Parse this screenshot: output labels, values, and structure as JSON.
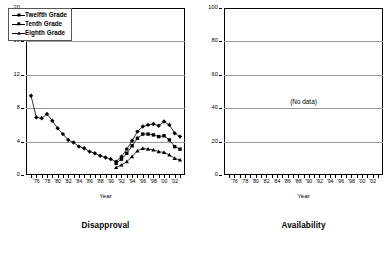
{
  "charts": [
    {
      "key": "disapproval",
      "title": "Disapproval",
      "xlabel": "Year",
      "nodata_text": ""
    },
    {
      "key": "availability",
      "title": "Availability",
      "xlabel": "Year",
      "nodata_text": "(No data)"
    }
  ],
  "legend": {
    "items": [
      {
        "label": "Twelfth Grade",
        "marker": "diamond"
      },
      {
        "label": "Tenth Grade",
        "marker": "square"
      },
      {
        "label": "Eighth Grade",
        "marker": "triangle"
      }
    ]
  },
  "chart_data": [
    {
      "type": "line",
      "title": "Disapproval",
      "xlabel": "Year",
      "ylabel": "",
      "ylim": [
        0,
        20
      ],
      "yticks": [
        0,
        4,
        8,
        12,
        16,
        20
      ],
      "grid": true,
      "legend_position": "top-left",
      "x": [
        1975,
        1976,
        1977,
        1978,
        1979,
        1980,
        1981,
        1982,
        1983,
        1984,
        1985,
        1986,
        1987,
        1988,
        1989,
        1990,
        1991,
        1992,
        1993,
        1994,
        1995,
        1996,
        1997,
        1998,
        1999,
        2000,
        2001,
        2002,
        2003
      ],
      "xtick_labels": [
        "'76",
        "'78",
        "'80",
        "'82",
        "'84",
        "'86",
        "'88",
        "'90",
        "'92",
        "'94",
        "'96",
        "'98",
        "'00",
        "'02"
      ],
      "series": [
        {
          "name": "Twelfth Grade",
          "marker": "diamond",
          "x": [
            1975,
            1976,
            1977,
            1978,
            1979,
            1980,
            1981,
            1982,
            1983,
            1984,
            1985,
            1986,
            1987,
            1988,
            1989,
            1990,
            1991,
            1992,
            1993,
            1994,
            1995,
            1996,
            1997,
            1998,
            1999,
            2000,
            2001,
            2002,
            2003
          ],
          "values": [
            9.5,
            6.9,
            6.8,
            7.3,
            6.5,
            5.6,
            4.9,
            4.2,
            3.9,
            3.4,
            3.2,
            2.8,
            2.6,
            2.3,
            2.1,
            1.9,
            1.6,
            2.2,
            3.1,
            4.1,
            5.2,
            5.8,
            6.0,
            6.1,
            5.9,
            6.4,
            6.0,
            5.0,
            4.6
          ]
        },
        {
          "name": "Tenth Grade",
          "marker": "square",
          "x": [
            1991,
            1992,
            1993,
            1994,
            1995,
            1996,
            1997,
            1998,
            1999,
            2000,
            2001,
            2002,
            2003
          ],
          "values": [
            1.4,
            1.9,
            2.6,
            3.5,
            4.4,
            4.9,
            4.9,
            4.8,
            4.6,
            4.7,
            4.2,
            3.4,
            3.1
          ]
        },
        {
          "name": "Eighth Grade",
          "marker": "triangle",
          "x": [
            1991,
            1992,
            1993,
            1994,
            1995,
            1996,
            1997,
            1998,
            1999,
            2000,
            2001,
            2002,
            2003
          ],
          "values": [
            0.9,
            1.2,
            1.6,
            2.2,
            2.9,
            3.2,
            3.1,
            3.0,
            2.8,
            2.7,
            2.4,
            2.0,
            1.8
          ]
        }
      ]
    },
    {
      "type": "line",
      "title": "Availability",
      "xlabel": "Year",
      "ylabel": "",
      "ylim": [
        0,
        100
      ],
      "yticks": [
        0,
        20,
        40,
        60,
        80,
        100
      ],
      "grid": true,
      "annotation": "(No data)",
      "xtick_labels": [
        "'76",
        "'78",
        "'80",
        "'82",
        "'84",
        "'86",
        "'88",
        "'90",
        "'92",
        "'94",
        "'96",
        "'98",
        "'00",
        "'02"
      ],
      "series": []
    }
  ]
}
